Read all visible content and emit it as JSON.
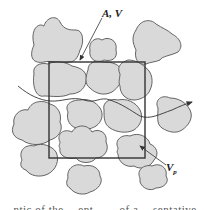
{
  "figure": {
    "labels": {
      "control_volume": "A, V",
      "pore_volume_main": "V",
      "pore_volume_sub": "p"
    },
    "caption_partial": "…ntic of the …ent…… of a …sentative …lu…"
  },
  "colors": {
    "grain_fill": "#d9d9d9",
    "grain_stroke": "#555555",
    "box_stroke": "#333333",
    "flow_line": "#333333",
    "background": "#ffffff"
  }
}
